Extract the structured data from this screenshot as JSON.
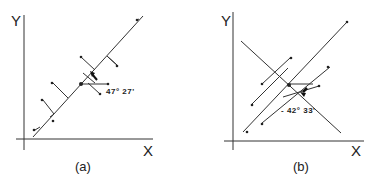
{
  "panels": [
    {
      "id": "a",
      "caption": "(a)",
      "x_label": "X",
      "y_label": "Y",
      "angle_label": "47° 27'",
      "description": "Data points with perpendicular projections onto a rising fitted line; arrow shows angle from horizontal at the mean point"
    },
    {
      "id": "b",
      "caption": "(b)",
      "x_label": "X",
      "y_label": "Y",
      "angle_label": "- 42° 33'",
      "description": "Data points projected along parallel lines onto a falling axis line; arrow shows negative angle at the center point"
    }
  ],
  "colors": {
    "ink": "#333333",
    "background": "#ffffff"
  }
}
